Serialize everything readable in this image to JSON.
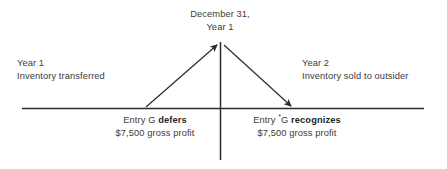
{
  "diagram": {
    "type": "timeline",
    "title_caption": {
      "line1": "December 31,",
      "line2": "Year 1"
    },
    "left_period": {
      "line1": "Year 1",
      "line2": "Inventory transferred"
    },
    "right_period": {
      "line1": "Year 2",
      "line2": "Inventory sold to outsider"
    },
    "left_entry": {
      "prefix": "Entry G ",
      "emphasis": "defers",
      "amount_line": "$7,500 gross profit"
    },
    "right_entry": {
      "prefix": "Entry ",
      "superscript": "*",
      "mid": "G ",
      "emphasis": "recognizes",
      "amount_line": "$7,500 gross profit"
    },
    "colors": {
      "background": "#ffffff",
      "text": "#3b3b3b",
      "emphasis_text": "#262626",
      "line": "#2b2b2b"
    }
  }
}
